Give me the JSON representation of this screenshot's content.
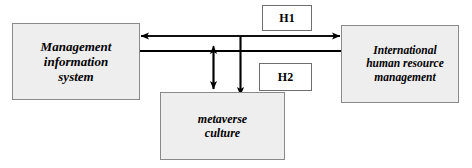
{
  "diagram": {
    "type": "research-model-path-diagram",
    "background_color": "#ffffff",
    "node_fill_color": "#eeeeee",
    "node_border_color": "#8a8a8a",
    "line_color": "#000000",
    "nodes": [
      {
        "id": "mis",
        "label": "Management information system",
        "line1": "Management",
        "line2": "information",
        "line3": "system"
      },
      {
        "id": "ihrm",
        "label": "International human resource management",
        "line1": "International",
        "line2": "human resource",
        "line3": "management"
      },
      {
        "id": "metaverse",
        "label": "metaverse culture",
        "line1": "metaverse",
        "line2": "culture"
      }
    ],
    "hypotheses": [
      {
        "id": "h1",
        "label": "H1"
      },
      {
        "id": "h2",
        "label": "H2"
      }
    ],
    "edges": [
      {
        "id": "edge-mis-ihrm-upper",
        "from": "ihrm",
        "to": "mis",
        "direction": "left",
        "hypothesis": "H1"
      },
      {
        "id": "edge-mis-ihrm-lower",
        "from": "mis",
        "to": "ihrm",
        "direction": "right",
        "hypothesis": "H1"
      },
      {
        "id": "edge-mis-metaverse",
        "from": "mis",
        "to": "metaverse",
        "direction": "both",
        "hypothesis": "H2"
      },
      {
        "id": "edge-upper-metaverse",
        "from": "mis",
        "to": "metaverse",
        "direction": "down",
        "hypothesis": "H2"
      }
    ]
  }
}
